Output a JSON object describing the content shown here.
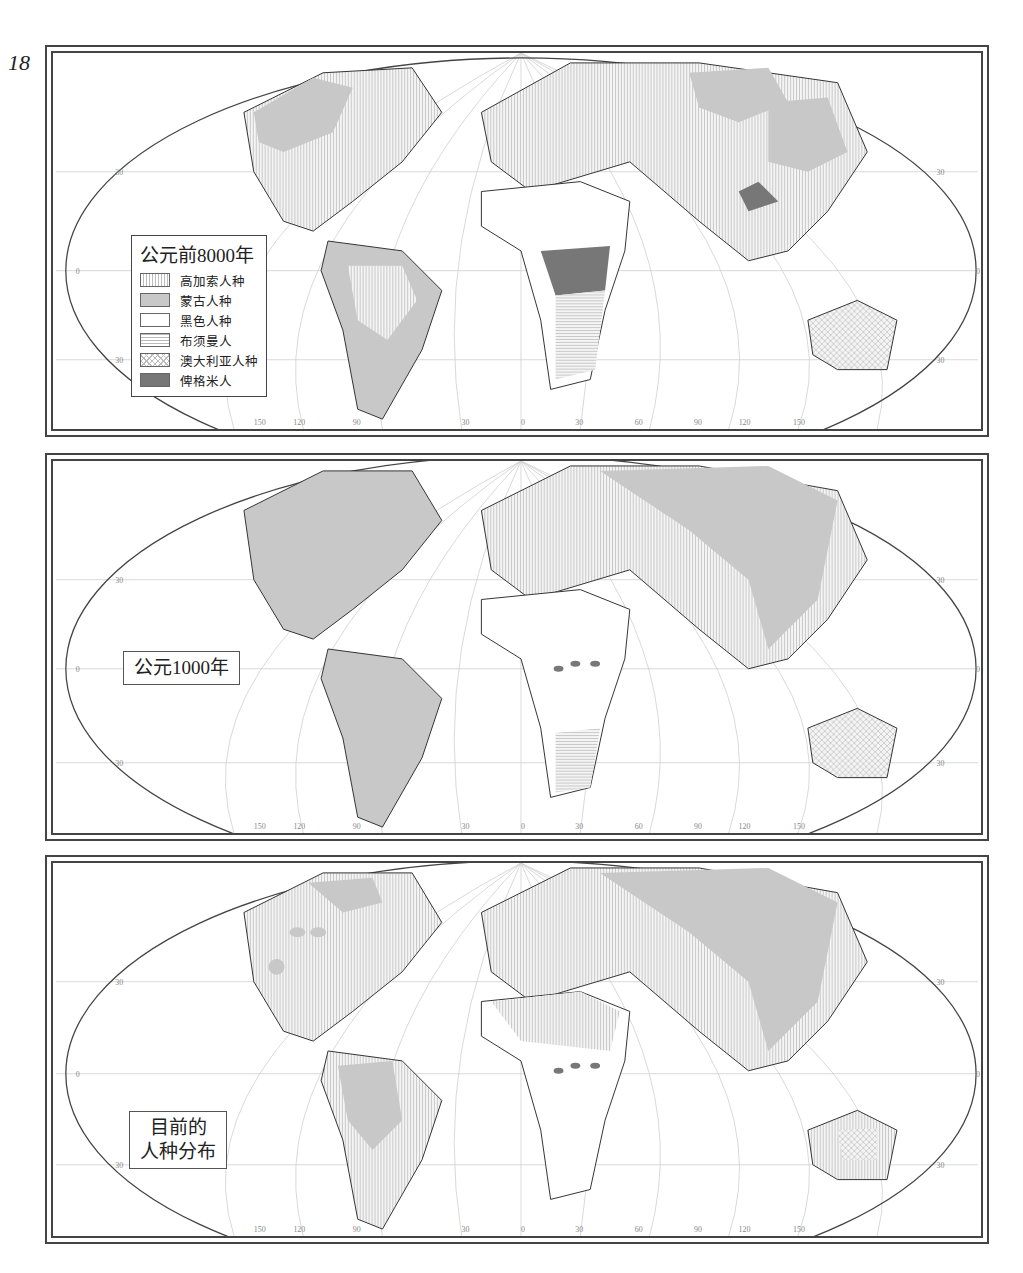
{
  "page_number": "18",
  "colors": {
    "frame": "#444444",
    "coast": "#333333",
    "graticule": "#cfcfcf",
    "caucasoid_hatch": "#bbbbbb",
    "mongoloid_fill": "#c8c8c8",
    "negroid_fill": "#ffffff",
    "pygmy_fill": "#777777"
  },
  "legend": {
    "title": "公元前8000年",
    "items": [
      {
        "label": "高加索人种",
        "pattern": "vertical-hatch"
      },
      {
        "label": "蒙古人种",
        "pattern": "light-gray"
      },
      {
        "label": "黑色人种",
        "pattern": "white"
      },
      {
        "label": "布须曼人",
        "pattern": "horizontal-hatch"
      },
      {
        "label": "澳大利亚人种",
        "pattern": "cross-hatch"
      },
      {
        "label": "俾格米人",
        "pattern": "dark-gray"
      }
    ]
  },
  "panels": [
    {
      "label": "公元前8000年",
      "shows_legend": true
    },
    {
      "label": "公元1000年",
      "shows_legend": false
    },
    {
      "label_line1": "目前的",
      "label_line2": "人种分布",
      "shows_legend": false
    }
  ],
  "axes": {
    "longitude_ticks": [
      "150",
      "120",
      "90",
      "30",
      "0",
      "30",
      "60",
      "90",
      "120",
      "150"
    ],
    "latitude_ticks": {
      "north": "30",
      "equator": "0",
      "south": "30"
    }
  }
}
